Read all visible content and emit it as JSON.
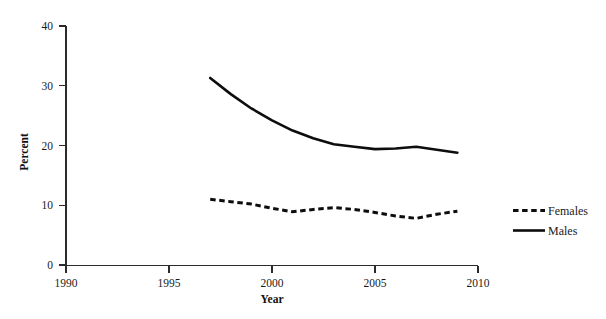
{
  "chart_data": {
    "type": "line",
    "title": "",
    "subtitle": "",
    "xlabel": "Year",
    "ylabel": "Percent",
    "xlim": [
      1990,
      2010
    ],
    "ylim": [
      0,
      40
    ],
    "xticks": [
      1990,
      1995,
      2000,
      2005,
      2010
    ],
    "xtick_labels": [
      "1990",
      "1995",
      "2000",
      "2005",
      "2010"
    ],
    "yticks": [
      0,
      10,
      20,
      30,
      40
    ],
    "ytick_labels": [
      "0",
      "10",
      "20",
      "30",
      "40"
    ],
    "grid": false,
    "legend_position": "right",
    "x": [
      1997,
      1998,
      1999,
      2000,
      2001,
      2002,
      2003,
      2004,
      2005,
      2006,
      2007,
      2008,
      2009
    ],
    "series": [
      {
        "name": "Females",
        "style": "dashed",
        "color": "#0d0d0d",
        "values": [
          11.0,
          10.6,
          10.2,
          9.5,
          8.9,
          9.3,
          9.6,
          9.3,
          8.8,
          8.2,
          7.8,
          8.5,
          9.0
        ]
      },
      {
        "name": "Males",
        "style": "solid",
        "color": "#0d0d0d",
        "values": [
          31.3,
          28.6,
          26.2,
          24.2,
          22.5,
          21.2,
          20.2,
          19.8,
          19.4,
          19.5,
          19.8,
          19.3,
          18.8
        ]
      }
    ],
    "annotations": []
  },
  "legend": {
    "entries": [
      {
        "label": "Females",
        "style": "dashed"
      },
      {
        "label": "Males",
        "style": "solid"
      }
    ]
  },
  "axis": {
    "x_title": "Year",
    "y_title": "Percent"
  }
}
